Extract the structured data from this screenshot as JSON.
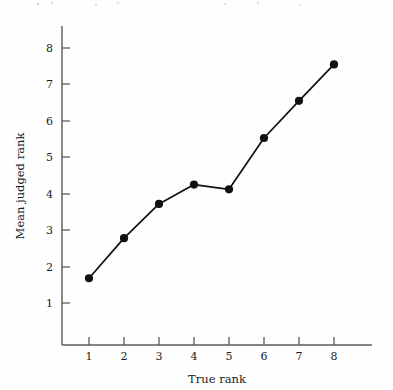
{
  "chart_data": {
    "type": "line",
    "title": "",
    "subtitle": "",
    "xlabel": "True rank",
    "ylabel": "Mean judged rank",
    "x": [
      1,
      2,
      3,
      4,
      5,
      6,
      7,
      8
    ],
    "values": [
      1.68,
      2.78,
      3.72,
      4.25,
      4.12,
      5.53,
      6.55,
      7.55
    ],
    "series": [
      {
        "name": "Mean judged rank",
        "values": [
          1.68,
          2.78,
          3.72,
          4.25,
          4.12,
          5.53,
          6.55,
          7.55
        ]
      }
    ],
    "xticks": [
      1,
      2,
      3,
      4,
      5,
      6,
      7,
      8
    ],
    "xtick_labels": [
      "1",
      "2",
      "3",
      "4",
      "5",
      "6",
      "7",
      "8"
    ],
    "yticks": [
      1,
      2,
      3,
      4,
      5,
      6,
      7,
      8
    ],
    "ytick_labels": [
      "1",
      "2",
      "3",
      "4",
      "5",
      "6",
      "7",
      "8"
    ],
    "xlim": [
      0.4,
      8.9
    ],
    "ylim": [
      0.25,
      8.6
    ],
    "grid": false,
    "legend": null,
    "legend_position": "none",
    "marker": "filled-circle",
    "marker_color": "#111111",
    "line_color": "#111111",
    "axis_color": "#5b5b5b",
    "background_color": "#fefefe"
  },
  "axes": {
    "x_axis_title": "True rank",
    "y_axis_title": "Mean judged rank"
  }
}
